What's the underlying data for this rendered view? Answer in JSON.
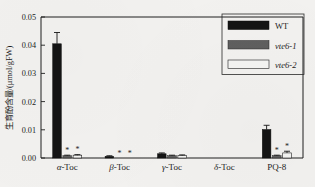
{
  "chart_data": {
    "type": "bar",
    "title": "",
    "xlabel": "",
    "ylabel": "生育酚含量/(μmol/gFW)",
    "ylim": [
      0.0,
      0.05
    ],
    "ytick_labels": [
      "0.00",
      "0.01",
      "0.02",
      "0.03",
      "0.04",
      "0.05"
    ],
    "ytick_values": [
      0.0,
      0.01,
      0.02,
      0.03,
      0.04,
      0.05
    ],
    "grid": false,
    "legend_position": "top-right-inside",
    "categories": [
      "α-Toc",
      "β-Toc",
      "γ-Toc",
      "δ-Toc",
      "PQ-8"
    ],
    "category_prefixes": [
      "α",
      "β",
      "γ",
      "δ",
      ""
    ],
    "category_suffixes": [
      "-Toc",
      "-Toc",
      "-Toc",
      "-Toc",
      "PQ-8"
    ],
    "series": [
      {
        "name": "WT",
        "italic": false,
        "color": "#141414",
        "values": [
          0.0405,
          0.0006,
          0.0015,
          0.0,
          0.0101
        ],
        "errors": [
          0.004,
          0.0002,
          0.0003,
          0.0,
          0.0015
        ],
        "significance": [
          "",
          "",
          "",
          "",
          ""
        ]
      },
      {
        "name": "vte6-1",
        "italic": true,
        "color": "#5f5f5f",
        "values": [
          0.0008,
          0.0,
          0.0008,
          0.0,
          0.0008
        ],
        "errors": [
          0.0002,
          0.0,
          0.0002,
          0.0,
          0.0002
        ],
        "significance": [
          "*",
          "*",
          "",
          "",
          "*"
        ]
      },
      {
        "name": "vte6-2",
        "italic": true,
        "color": "#f4f4f2",
        "values": [
          0.001,
          0.0,
          0.0009,
          0.0,
          0.0018
        ],
        "errors": [
          0.0002,
          0.0,
          0.0002,
          0.0,
          0.0006
        ],
        "significance": [
          "*",
          "*",
          "",
          "",
          "*"
        ]
      }
    ]
  },
  "legend": {
    "entries": [
      {
        "label": "WT",
        "swatch": "wt-swatch"
      },
      {
        "label": "vte6-1",
        "swatch": "vte6-1-swatch"
      },
      {
        "label": "vte6-2",
        "swatch": "vte6-2-swatch"
      }
    ]
  },
  "colors": {
    "wt": "#141414",
    "vte6_1": "#5f5f5f",
    "vte6_2": "#f4f4f2",
    "axis": "#1f1f1f",
    "page_background": "#f2f1ef"
  }
}
